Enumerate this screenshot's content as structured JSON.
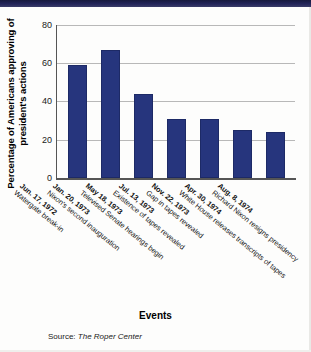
{
  "chart_data": {
    "type": "bar",
    "title": "",
    "xlabel": "Events",
    "ylabel": "Percentage of Americans approving of president's actions",
    "ylim": [
      0,
      80
    ],
    "yticks": [
      0,
      20,
      40,
      60,
      80
    ],
    "grid": true,
    "legend": null,
    "bar_color": "#26357d",
    "categories": [
      "Jun. 17, 1972 Watergate break-in",
      "Jan. 20, 1973 Nixon's second inauguration",
      "May 18, 1973 Televised Senate hearings begin",
      "Jul. 13, 1973 Existence of tapes revealed",
      "Nov. 22, 1973 Gap in tapes revealed",
      "Apr. 30, 1974 White House releases transcripts of tapes",
      "Aug. 8, 1974 Richard Nixon resigns presidency"
    ],
    "values": [
      59,
      67,
      44,
      31,
      31,
      25,
      24
    ],
    "points": [
      {
        "date": "Jun. 17, 1972",
        "event": "Watergate break-in",
        "value": 59
      },
      {
        "date": "Jan. 20, 1973",
        "event": "Nixon's second inauguration",
        "value": 67
      },
      {
        "date": "May 18, 1973",
        "event": "Televised Senate hearings begin",
        "value": 44
      },
      {
        "date": "Jul. 13, 1973",
        "event": "Existence of tapes revealed",
        "value": 31
      },
      {
        "date": "Nov. 22, 1973",
        "event": "Gap in tapes revealed",
        "value": 31
      },
      {
        "date": "Apr. 30, 1974",
        "event": "White House releases transcripts of tapes",
        "value": 25
      },
      {
        "date": "Aug. 8, 1974",
        "event": "Richard Nixon resigns presidency",
        "value": 24
      }
    ]
  },
  "axis": {
    "y_title": "Percentage of Americans approving of president's actions",
    "x_title": "Events",
    "tick_0": "0",
    "tick_20": "20",
    "tick_40": "40",
    "tick_60": "60",
    "tick_80": "80"
  },
  "footer": {
    "source_prefix": "Source:",
    "source_name": "The Roper Center"
  }
}
